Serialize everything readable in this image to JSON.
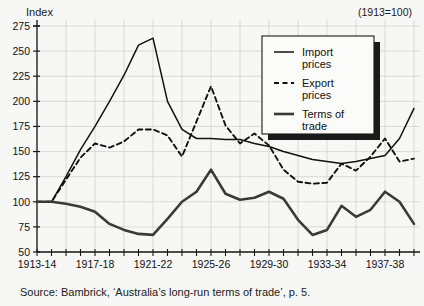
{
  "axis_title": "Index",
  "base_note": "(1913=100)",
  "source": "Source: Bambrick, ‘Australia’s long-run terms of trade’, p. 5.",
  "legend": {
    "items": [
      {
        "label_line1": "Import",
        "label_line2": "prices",
        "style": "solid-thin"
      },
      {
        "label_line1": "Export",
        "label_line2": "prices",
        "style": "dashed"
      },
      {
        "label_line1": "Terms of",
        "label_line2": "trade",
        "style": "solid-thick"
      }
    ]
  },
  "chart_data": {
    "type": "line",
    "title": "",
    "subtitle": "(1913=100)",
    "xlabel": "",
    "ylabel": "Index",
    "ylim": [
      50,
      275
    ],
    "ytick_step": 25,
    "yticks": [
      50,
      75,
      100,
      125,
      150,
      175,
      200,
      225,
      250,
      275
    ],
    "ytick_labels": [
      "50",
      "75",
      "100",
      "125",
      "150",
      "175",
      "200",
      "225",
      "250",
      "275"
    ],
    "grid": true,
    "legend_position": "upper-right",
    "x": [
      "1913-14",
      "1914-15",
      "1915-16",
      "1916-17",
      "1917-18",
      "1918-19",
      "1919-20",
      "1920-21",
      "1921-22",
      "1922-23",
      "1923-24",
      "1924-25",
      "1925-26",
      "1926-27",
      "1927-28",
      "1928-29",
      "1929-30",
      "1930-31",
      "1931-32",
      "1932-33",
      "1933-34",
      "1934-35",
      "1935-36",
      "1936-37",
      "1937-38",
      "1938-39",
      "1939-40"
    ],
    "xtick_labels": [
      "1913-14",
      "1917-18",
      "1921-22",
      "1925-26",
      "1929-30",
      "1933-34",
      "1937-38"
    ],
    "xtick_label_indices": [
      0,
      4,
      8,
      12,
      16,
      20,
      24
    ],
    "series": [
      {
        "name": "Import prices",
        "style": "solid-thin",
        "values": [
          100,
          100,
          125,
          152,
          175,
          200,
          226,
          256,
          263,
          200,
          172,
          163,
          163,
          162,
          162,
          158,
          155,
          150,
          146,
          142,
          140,
          138,
          140,
          143,
          146,
          163,
          193
        ]
      },
      {
        "name": "Export prices",
        "style": "dashed",
        "values": [
          100,
          100,
          122,
          144,
          158,
          154,
          160,
          172,
          172,
          166,
          145,
          180,
          215,
          176,
          158,
          168,
          156,
          132,
          120,
          118,
          119,
          138,
          131,
          145,
          163,
          140,
          143
        ]
      },
      {
        "name": "Terms of trade",
        "style": "solid-thick",
        "values": [
          100,
          100,
          98,
          95,
          90,
          78,
          72,
          68,
          67,
          83,
          100,
          110,
          132,
          108,
          102,
          104,
          110,
          103,
          82,
          67,
          72,
          96,
          85,
          92,
          110,
          100,
          78
        ]
      }
    ]
  }
}
